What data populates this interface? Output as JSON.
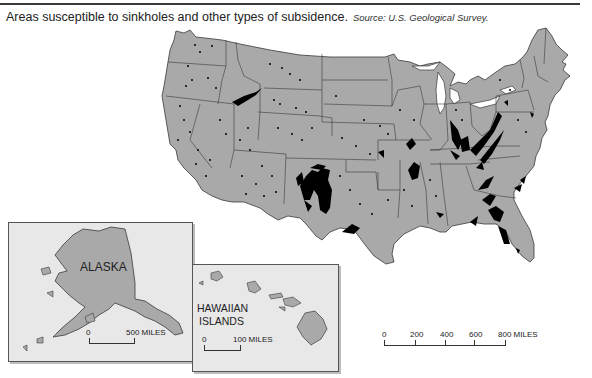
{
  "caption": {
    "title": "Areas susceptible to sinkholes and other types of subsidence.",
    "source": "Source: U.S. Geological Survey."
  },
  "colors": {
    "land": "#a9a9a9",
    "sinkhole_area": "#000000",
    "inset_background": "#e8e8e8",
    "border": "#333333"
  },
  "main_map": {
    "region": "Contiguous United States",
    "scale": {
      "ticks": [
        "0",
        "200",
        "400",
        "600",
        "800 MILES"
      ]
    }
  },
  "insets": {
    "alaska": {
      "label": "ALASKA",
      "scale": {
        "start": "0",
        "end": "500 MILES"
      }
    },
    "hawaii": {
      "label_line1": "HAWAIIAN",
      "label_line2": "ISLANDS",
      "scale": {
        "start": "0",
        "end": "100 MILES"
      }
    }
  },
  "legend_meaning": {
    "black_areas": "Areas susceptible to sinkholes and subsidence"
  }
}
